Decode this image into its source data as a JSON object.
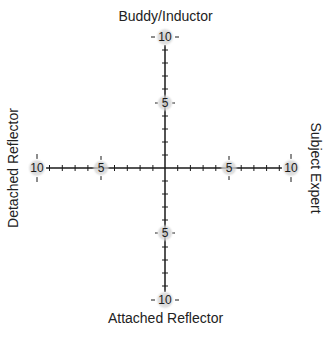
{
  "diagram": {
    "type": "quadrant-axes",
    "labels": {
      "top": "Buddy/Inductor",
      "bottom": "Attached Reflector",
      "left": "Detached Reflector",
      "right": "Subject Expert"
    },
    "x_axis": {
      "min": -10,
      "max": 10,
      "major_ticks": [
        10,
        5,
        5,
        10
      ],
      "minor_step": 1
    },
    "y_axis": {
      "min": -10,
      "max": 10,
      "major_ticks": [
        "10",
        "5",
        "-5",
        "-10"
      ],
      "minor_step": 1
    },
    "tick_labels": {
      "left_outer": "10",
      "left_mid": "5",
      "right_mid": "5",
      "right_outer": "10",
      "top_outer": "10",
      "top_mid": "5",
      "bottom_mid": "5",
      "bottom_outer": "10"
    },
    "colors": {
      "axis": "#1a1a1a",
      "label_halo": "#cfcfcf",
      "text": "#222222"
    }
  }
}
